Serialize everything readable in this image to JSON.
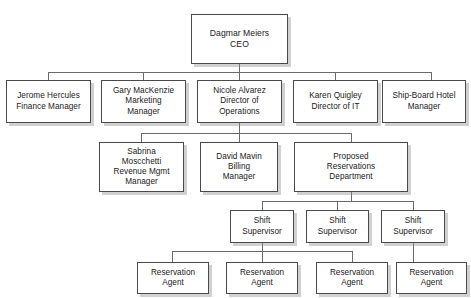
{
  "chart": {
    "type": "org-chart",
    "title": "",
    "background_color": "#ffffff",
    "box_border_color": "#4a4a4a",
    "line_color": "#6b6b6b",
    "text_color": "#1a1a1a",
    "levels": 5
  },
  "nodes": {
    "ceo": "Dagmar Meiers\nCEO",
    "finance_manager": "Jerome Hercules\nFinance Manager",
    "marketing_manager": "Gary MacKenzie\nMarketing\nManager",
    "director_operations": "Nicole Alvarez\nDirector of\nOperations",
    "director_it": "Karen Quigley\nDirector of IT",
    "hotel_manager": "Ship-Board Hotel\nManager",
    "revenue_manager": "Sabrina\nMoscchetti\nRevenue Mgmt\nManager",
    "billing_manager": "David Mavin\nBilling\nManager",
    "proposed_department": "Proposed\nReservations\nDepartment",
    "shift_supervisor_1": "Shift\nSupervisor",
    "shift_supervisor_2": "Shift\nSupervisor",
    "shift_supervisor_3": "Shift\nSupervisor",
    "reservation_agent_1": "Reservation\nAgent",
    "reservation_agent_2": "Reservation\nAgent",
    "reservation_agent_3": "Reservation\nAgent",
    "reservation_agent_4": "Reservation\nAgent"
  }
}
